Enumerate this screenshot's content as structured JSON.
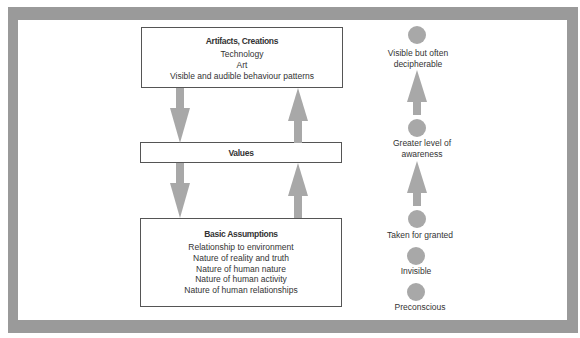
{
  "colors": {
    "frame": "#9a9a9a",
    "arrow": "#a8a8a8",
    "circle": "#a8a8a8",
    "box_border": "#555555",
    "text": "#333333"
  },
  "levels_diagram": {
    "artifacts": {
      "title": "Artifacts, Creations",
      "items": [
        "Technology",
        "Art",
        "Visible and audible behaviour patterns"
      ]
    },
    "values": {
      "title": "Values"
    },
    "assumptions": {
      "title": "Basic Assumptions",
      "items": [
        "Relationship to environment",
        "Nature of reality and truth",
        "Nature of human nature",
        "Nature of human activity",
        "Nature of human relationships"
      ]
    },
    "arrows": [
      {
        "from": "artifacts",
        "to": "values",
        "direction": "down",
        "icon": "arrow-down-icon"
      },
      {
        "from": "values",
        "to": "artifacts",
        "direction": "up",
        "icon": "arrow-up-icon"
      },
      {
        "from": "values",
        "to": "assumptions",
        "direction": "down",
        "icon": "arrow-down-icon"
      },
      {
        "from": "assumptions",
        "to": "values",
        "direction": "up",
        "icon": "arrow-up-icon"
      }
    ]
  },
  "awareness_scale": {
    "labels": [
      {
        "line1": "Visible but often",
        "line2": "decipherable"
      },
      {
        "line1": "Greater level of",
        "line2": "awareness"
      },
      {
        "line1": "Taken for granted"
      },
      {
        "line1": "Invisible"
      },
      {
        "line1": "Preconscious"
      }
    ],
    "arrows": [
      {
        "direction": "up",
        "icon": "arrow-up-icon"
      },
      {
        "direction": "up",
        "icon": "arrow-up-icon"
      }
    ]
  }
}
